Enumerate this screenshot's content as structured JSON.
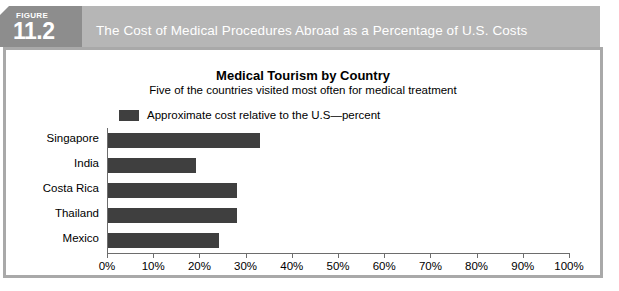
{
  "banner": {
    "figure_word": "FIGURE",
    "figure_number": "11.2",
    "title": "The Cost of Medical Procedures Abroad as a Percentage of U.S. Costs",
    "bar_color": "#b6b6b6",
    "badge_color": "#8d8d8d",
    "text_color": "#ffffff"
  },
  "chart_data": {
    "type": "bar",
    "orientation": "horizontal",
    "title": "Medical Tourism by Country",
    "subtitle": "Five of the countries visited most often for medical treatment",
    "categories": [
      "Singapore",
      "India",
      "Costa Rica",
      "Thailand",
      "Mexico"
    ],
    "values": [
      33,
      19,
      28,
      28,
      24
    ],
    "series": [
      {
        "name": "Approximate cost relative to the U.S—percent",
        "values": [
          33,
          19,
          28,
          28,
          24
        ],
        "color": "#3f3f3f"
      }
    ],
    "xlabel": "",
    "ylabel": "",
    "xlim": [
      0,
      100
    ],
    "xtick_labels": [
      "0%",
      "10%",
      "20%",
      "30%",
      "40%",
      "50%",
      "60%",
      "70%",
      "80%",
      "90%",
      "100%"
    ],
    "xticks": [
      0,
      10,
      20,
      30,
      40,
      50,
      60,
      70,
      80,
      90,
      100
    ],
    "grid": false,
    "legend": {
      "position": "top-left",
      "entries": [
        "Approximate cost relative to the U.S—percent"
      ]
    }
  },
  "footer": {
    "source_text": ""
  }
}
